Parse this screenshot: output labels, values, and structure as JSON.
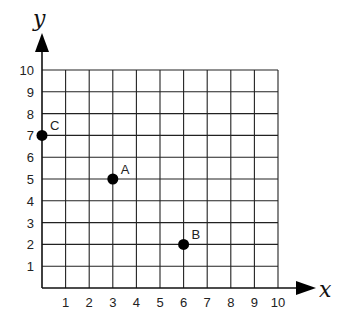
{
  "chart_data": {
    "type": "scatter",
    "title": "",
    "xlabel": "x",
    "ylabel": "y",
    "xlim": [
      0,
      10
    ],
    "ylim": [
      0,
      10
    ],
    "grid": true,
    "x_ticks": [
      "1",
      "2",
      "3",
      "4",
      "5",
      "6",
      "7",
      "8",
      "9",
      "10"
    ],
    "y_ticks": [
      "1",
      "2",
      "3",
      "4",
      "5",
      "6",
      "7",
      "8",
      "9",
      "10"
    ],
    "points": [
      {
        "label": "A",
        "x": 3,
        "y": 5
      },
      {
        "label": "B",
        "x": 6,
        "y": 2
      },
      {
        "label": "C",
        "x": 0,
        "y": 7
      }
    ]
  },
  "colors": {
    "grid": "#222222",
    "point": "#000000"
  }
}
